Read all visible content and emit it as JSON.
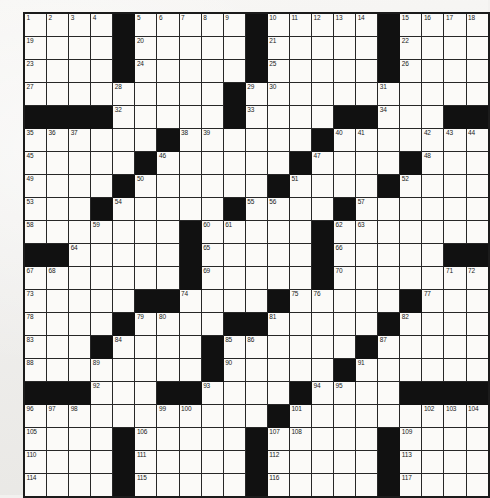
{
  "puzzle": {
    "type": "crossword-grid",
    "rows": 21,
    "columns": 21,
    "highest_clue_number": 117,
    "colors": {
      "paper": "#f3f2f0",
      "cell_fill": "#fbfaf8",
      "block_fill": "#111111",
      "grid_line": "#272727",
      "number_text": "#1a1a1a"
    },
    "legend": {
      "black_key": 1,
      "white_key": 0,
      "note": "grid[r][c] = 1 means a blocked (black) square"
    },
    "grid": [
      [
        0,
        0,
        0,
        0,
        1,
        0,
        0,
        0,
        0,
        0,
        1,
        0,
        0,
        0,
        0,
        0,
        1,
        0,
        0,
        0,
        0
      ],
      [
        0,
        0,
        0,
        0,
        1,
        0,
        0,
        0,
        0,
        0,
        1,
        0,
        0,
        0,
        0,
        0,
        1,
        0,
        0,
        0,
        0
      ],
      [
        0,
        0,
        0,
        0,
        1,
        0,
        0,
        0,
        0,
        0,
        1,
        0,
        0,
        0,
        0,
        0,
        1,
        0,
        0,
        0,
        0
      ],
      [
        0,
        0,
        0,
        0,
        0,
        0,
        0,
        0,
        0,
        1,
        0,
        0,
        0,
        0,
        0,
        0,
        0,
        0,
        0,
        0,
        0
      ],
      [
        1,
        1,
        1,
        1,
        0,
        0,
        0,
        0,
        0,
        1,
        0,
        0,
        0,
        0,
        1,
        1,
        0,
        0,
        0,
        1,
        1
      ],
      [
        0,
        0,
        0,
        0,
        0,
        0,
        1,
        0,
        0,
        0,
        0,
        0,
        0,
        1,
        0,
        0,
        0,
        0,
        0,
        0,
        0
      ],
      [
        0,
        0,
        0,
        0,
        0,
        1,
        0,
        0,
        0,
        0,
        0,
        0,
        1,
        0,
        0,
        0,
        0,
        1,
        0,
        0,
        0
      ],
      [
        0,
        0,
        0,
        0,
        1,
        0,
        0,
        0,
        0,
        0,
        0,
        1,
        0,
        0,
        0,
        0,
        1,
        0,
        0,
        0,
        0
      ],
      [
        0,
        0,
        0,
        1,
        0,
        0,
        0,
        0,
        0,
        1,
        0,
        0,
        0,
        0,
        1,
        0,
        0,
        0,
        0,
        0,
        0
      ],
      [
        0,
        0,
        0,
        0,
        0,
        0,
        0,
        1,
        0,
        0,
        0,
        0,
        0,
        1,
        0,
        0,
        0,
        0,
        0,
        0,
        0
      ],
      [
        1,
        1,
        0,
        0,
        0,
        0,
        0,
        1,
        0,
        0,
        0,
        0,
        0,
        1,
        0,
        0,
        0,
        0,
        0,
        1,
        1
      ],
      [
        0,
        0,
        0,
        0,
        0,
        0,
        0,
        1,
        0,
        0,
        0,
        0,
        0,
        1,
        0,
        0,
        0,
        0,
        0,
        0,
        0
      ],
      [
        0,
        0,
        0,
        0,
        0,
        1,
        1,
        0,
        0,
        0,
        0,
        1,
        0,
        0,
        0,
        0,
        0,
        1,
        0,
        0,
        0
      ],
      [
        0,
        0,
        0,
        0,
        1,
        0,
        0,
        0,
        0,
        1,
        1,
        0,
        0,
        0,
        0,
        0,
        1,
        0,
        0,
        0,
        0
      ],
      [
        0,
        0,
        0,
        1,
        0,
        0,
        0,
        0,
        1,
        0,
        0,
        0,
        0,
        0,
        0,
        1,
        0,
        0,
        0,
        0,
        0
      ],
      [
        0,
        0,
        0,
        0,
        0,
        0,
        0,
        0,
        1,
        0,
        0,
        0,
        0,
        0,
        1,
        0,
        0,
        0,
        0,
        0,
        0
      ],
      [
        1,
        1,
        1,
        0,
        0,
        0,
        1,
        1,
        0,
        0,
        0,
        0,
        1,
        0,
        0,
        0,
        0,
        1,
        1,
        1,
        1
      ],
      [
        0,
        0,
        0,
        0,
        0,
        0,
        0,
        0,
        0,
        0,
        0,
        1,
        0,
        0,
        0,
        0,
        0,
        0,
        0,
        0,
        0
      ],
      [
        0,
        0,
        0,
        0,
        1,
        0,
        0,
        0,
        0,
        0,
        1,
        0,
        0,
        0,
        0,
        0,
        1,
        0,
        0,
        0,
        0
      ],
      [
        0,
        0,
        0,
        0,
        1,
        0,
        0,
        0,
        0,
        0,
        1,
        0,
        0,
        0,
        0,
        0,
        1,
        0,
        0,
        0,
        0
      ],
      [
        0,
        0,
        0,
        0,
        1,
        0,
        0,
        0,
        0,
        0,
        1,
        0,
        0,
        0,
        0,
        0,
        1,
        0,
        0,
        0,
        0
      ]
    ],
    "numbers": [
      {
        "row": 0,
        "col": 0,
        "n": 1
      },
      {
        "row": 0,
        "col": 1,
        "n": 2
      },
      {
        "row": 0,
        "col": 2,
        "n": 3
      },
      {
        "row": 0,
        "col": 3,
        "n": 4
      },
      {
        "row": 0,
        "col": 5,
        "n": 5
      },
      {
        "row": 0,
        "col": 6,
        "n": 6
      },
      {
        "row": 0,
        "col": 7,
        "n": 7
      },
      {
        "row": 0,
        "col": 8,
        "n": 8
      },
      {
        "row": 0,
        "col": 9,
        "n": 9
      },
      {
        "row": 0,
        "col": 11,
        "n": 10
      },
      {
        "row": 0,
        "col": 12,
        "n": 11
      },
      {
        "row": 0,
        "col": 13,
        "n": 12
      },
      {
        "row": 0,
        "col": 14,
        "n": 13
      },
      {
        "row": 0,
        "col": 15,
        "n": 14
      },
      {
        "row": 0,
        "col": 17,
        "n": 15
      },
      {
        "row": 0,
        "col": 18,
        "n": 16
      },
      {
        "row": 0,
        "col": 19,
        "n": 17
      },
      {
        "row": 0,
        "col": 20,
        "n": 18
      },
      {
        "row": 1,
        "col": 0,
        "n": 19
      },
      {
        "row": 1,
        "col": 5,
        "n": 20
      },
      {
        "row": 1,
        "col": 11,
        "n": 21
      },
      {
        "row": 1,
        "col": 17,
        "n": 22
      },
      {
        "row": 2,
        "col": 0,
        "n": 23
      },
      {
        "row": 2,
        "col": 5,
        "n": 24
      },
      {
        "row": 2,
        "col": 11,
        "n": 25
      },
      {
        "row": 2,
        "col": 17,
        "n": 26
      },
      {
        "row": 3,
        "col": 0,
        "n": 27
      },
      {
        "row": 3,
        "col": 4,
        "n": 28
      },
      {
        "row": 3,
        "col": 10,
        "n": 29
      },
      {
        "row": 3,
        "col": 11,
        "n": 30
      },
      {
        "row": 3,
        "col": 16,
        "n": 31
      },
      {
        "row": 4,
        "col": 4,
        "n": 32
      },
      {
        "row": 4,
        "col": 10,
        "n": 33
      },
      {
        "row": 4,
        "col": 16,
        "n": 34
      },
      {
        "row": 5,
        "col": 0,
        "n": 35
      },
      {
        "row": 5,
        "col": 1,
        "n": 36
      },
      {
        "row": 5,
        "col": 2,
        "n": 37
      },
      {
        "row": 5,
        "col": 7,
        "n": 38
      },
      {
        "row": 5,
        "col": 8,
        "n": 39
      },
      {
        "row": 5,
        "col": 14,
        "n": 40
      },
      {
        "row": 5,
        "col": 15,
        "n": 41
      },
      {
        "row": 5,
        "col": 18,
        "n": 42
      },
      {
        "row": 5,
        "col": 19,
        "n": 43
      },
      {
        "row": 5,
        "col": 20,
        "n": 44
      },
      {
        "row": 6,
        "col": 0,
        "n": 45
      },
      {
        "row": 6,
        "col": 6,
        "n": 46
      },
      {
        "row": 6,
        "col": 13,
        "n": 47
      },
      {
        "row": 6,
        "col": 18,
        "n": 48
      },
      {
        "row": 7,
        "col": 0,
        "n": 49
      },
      {
        "row": 7,
        "col": 5,
        "n": 50
      },
      {
        "row": 7,
        "col": 12,
        "n": 51
      },
      {
        "row": 7,
        "col": 17,
        "n": 52
      },
      {
        "row": 8,
        "col": 0,
        "n": 53
      },
      {
        "row": 8,
        "col": 4,
        "n": 54
      },
      {
        "row": 8,
        "col": 10,
        "n": 55
      },
      {
        "row": 8,
        "col": 11,
        "n": 56
      },
      {
        "row": 8,
        "col": 15,
        "n": 57
      },
      {
        "row": 9,
        "col": 0,
        "n": 58
      },
      {
        "row": 9,
        "col": 3,
        "n": 59
      },
      {
        "row": 9,
        "col": 8,
        "n": 60
      },
      {
        "row": 9,
        "col": 9,
        "n": 61
      },
      {
        "row": 9,
        "col": 14,
        "n": 62
      },
      {
        "row": 9,
        "col": 15,
        "n": 63
      },
      {
        "row": 10,
        "col": 2,
        "n": 64
      },
      {
        "row": 10,
        "col": 8,
        "n": 65
      },
      {
        "row": 10,
        "col": 14,
        "n": 66
      },
      {
        "row": 11,
        "col": 0,
        "n": 67
      },
      {
        "row": 11,
        "col": 1,
        "n": 68
      },
      {
        "row": 11,
        "col": 8,
        "n": 69
      },
      {
        "row": 11,
        "col": 14,
        "n": 70
      },
      {
        "row": 11,
        "col": 19,
        "n": 71
      },
      {
        "row": 11,
        "col": 20,
        "n": 72
      },
      {
        "row": 12,
        "col": 0,
        "n": 73
      },
      {
        "row": 12,
        "col": 7,
        "n": 74
      },
      {
        "row": 12,
        "col": 12,
        "n": 75
      },
      {
        "row": 12,
        "col": 13,
        "n": 76
      },
      {
        "row": 12,
        "col": 18,
        "n": 77
      },
      {
        "row": 13,
        "col": 0,
        "n": 78
      },
      {
        "row": 13,
        "col": 5,
        "n": 79
      },
      {
        "row": 13,
        "col": 6,
        "n": 80
      },
      {
        "row": 13,
        "col": 11,
        "n": 81
      },
      {
        "row": 13,
        "col": 17,
        "n": 82
      },
      {
        "row": 14,
        "col": 0,
        "n": 83
      },
      {
        "row": 14,
        "col": 4,
        "n": 84
      },
      {
        "row": 14,
        "col": 9,
        "n": 85
      },
      {
        "row": 14,
        "col": 10,
        "n": 86
      },
      {
        "row": 14,
        "col": 16,
        "n": 87
      },
      {
        "row": 15,
        "col": 0,
        "n": 88
      },
      {
        "row": 15,
        "col": 3,
        "n": 89
      },
      {
        "row": 15,
        "col": 9,
        "n": 90
      },
      {
        "row": 15,
        "col": 15,
        "n": 91
      },
      {
        "row": 16,
        "col": 3,
        "n": 92
      },
      {
        "row": 16,
        "col": 8,
        "n": 93
      },
      {
        "row": 16,
        "col": 13,
        "n": 94
      },
      {
        "row": 16,
        "col": 14,
        "n": 95
      },
      {
        "row": 17,
        "col": 0,
        "n": 96
      },
      {
        "row": 17,
        "col": 1,
        "n": 97
      },
      {
        "row": 17,
        "col": 2,
        "n": 98
      },
      {
        "row": 17,
        "col": 6,
        "n": 99
      },
      {
        "row": 17,
        "col": 7,
        "n": 100
      },
      {
        "row": 17,
        "col": 12,
        "n": 101
      },
      {
        "row": 17,
        "col": 18,
        "n": 102
      },
      {
        "row": 17,
        "col": 19,
        "n": 103
      },
      {
        "row": 17,
        "col": 20,
        "n": 104
      },
      {
        "row": 18,
        "col": 0,
        "n": 105
      },
      {
        "row": 18,
        "col": 5,
        "n": 106
      },
      {
        "row": 18,
        "col": 11,
        "n": 107
      },
      {
        "row": 18,
        "col": 12,
        "n": 108
      },
      {
        "row": 18,
        "col": 17,
        "n": 109
      },
      {
        "row": 19,
        "col": 0,
        "n": 110
      },
      {
        "row": 19,
        "col": 5,
        "n": 111
      },
      {
        "row": 19,
        "col": 11,
        "n": 112
      },
      {
        "row": 19,
        "col": 17,
        "n": 113
      },
      {
        "row": 20,
        "col": 0,
        "n": 114
      },
      {
        "row": 20,
        "col": 5,
        "n": 115
      },
      {
        "row": 20,
        "col": 11,
        "n": 116
      },
      {
        "row": 20,
        "col": 17,
        "n": 117
      }
    ]
  }
}
